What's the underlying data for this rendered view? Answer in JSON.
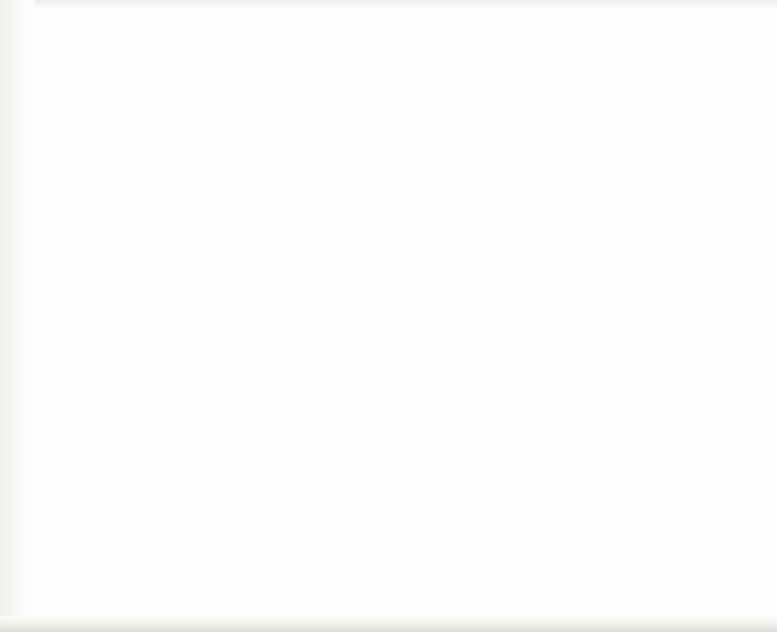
{
  "figure": {
    "copyright": "Copyright © 2018, Springer International Publishing AG, part of Springer Nature",
    "xlabel": "Effective Washcoat Depth (micron)"
  },
  "legend": {
    "position": "top-right",
    "entries": [
      {
        "label": "1 + 1D",
        "marker": "circle",
        "color": "#9c5334",
        "edge": "#5b3222"
      },
      {
        "label": "Asymptotic",
        "marker": "line",
        "color": "#6f6fc6"
      }
    ]
  },
  "colors": {
    "marker_fill": "#9c5334",
    "marker_edge": "#5b3222",
    "line": "#6f6fc6",
    "axis": "#3a3a3a",
    "grid": "#b9b9b9",
    "text": "#151515",
    "background": "#ffffff"
  },
  "chart_data": [
    {
      "type": "scatter",
      "panel": "top",
      "title": "",
      "xlabel": "Effective Washcoat Depth (micron)",
      "ylabel": "NH3 (ppm)",
      "xlim": [
        0,
        55
      ],
      "ylim": [
        20,
        412
      ],
      "xticks": [
        0,
        10,
        20,
        30,
        40,
        50,
        55
      ],
      "yticks": [
        100,
        200,
        300,
        400
      ],
      "grid": true,
      "legend": [
        "1 + 1D",
        "Asymptotic"
      ],
      "series": [
        {
          "name": "1 + 1D",
          "style": "markers",
          "x": [
            0,
            2,
            4,
            6,
            8,
            10,
            12,
            14,
            16,
            18,
            20,
            22,
            24,
            26,
            28,
            30,
            32,
            34,
            36,
            38,
            40,
            42,
            44,
            46,
            48,
            50,
            52
          ],
          "values": [
            349,
            333,
            320,
            305,
            292,
            278,
            265,
            252,
            240,
            228,
            216,
            205,
            194,
            184,
            174,
            164,
            155,
            147,
            139,
            131,
            124,
            117,
            111,
            105,
            100,
            95,
            91
          ]
        },
        {
          "name": "Asymptotic",
          "style": "line",
          "x": [
            0,
            2,
            4,
            6,
            8,
            10,
            12,
            14,
            16,
            18,
            20,
            22,
            24,
            26,
            28,
            30,
            32,
            34,
            36,
            38,
            40,
            42,
            44,
            46,
            48,
            50,
            52,
            53
          ],
          "values": [
            355,
            340,
            325,
            311,
            297,
            283,
            270,
            257,
            244,
            232,
            220,
            209,
            198,
            188,
            178,
            168,
            159,
            150,
            142,
            134,
            127,
            120,
            113,
            107,
            102,
            97,
            92,
            90
          ]
        }
      ]
    },
    {
      "type": "scatter",
      "panel": "bottom",
      "title": "",
      "xlabel": "Effective Washcoat Depth (micron)",
      "ylabel": "NO (ppm)",
      "xlim": [
        0,
        55
      ],
      "ylim": [
        200,
        400
      ],
      "xticks": [
        0,
        10,
        20,
        30,
        40,
        50,
        55
      ],
      "yticks": [
        200,
        250,
        300,
        350,
        400
      ],
      "grid": true,
      "legend": [
        "1 + 1D",
        "Asymptotic"
      ],
      "series": [
        {
          "name": "1 + 1D",
          "style": "markers",
          "x": [
            0,
            2,
            4,
            6,
            8,
            10,
            12,
            14,
            16,
            18,
            20,
            22,
            24,
            26,
            28,
            30,
            32,
            34,
            36,
            38,
            40,
            42,
            44,
            46,
            48,
            50,
            52
          ],
          "values": [
            400,
            389,
            373,
            360,
            348,
            338,
            324,
            314,
            305,
            297,
            288,
            282,
            275,
            269,
            263,
            257,
            252,
            248,
            244,
            240,
            237,
            233,
            230,
            228,
            225,
            223,
            221
          ]
        },
        {
          "name": "Asymptotic",
          "style": "line",
          "x": [
            0,
            2,
            4,
            6,
            8,
            10,
            12,
            14,
            16,
            18,
            20,
            22,
            24,
            26,
            28,
            30,
            32,
            34,
            36,
            38,
            40,
            42,
            44,
            46,
            48,
            50,
            52,
            53
          ],
          "values": [
            400,
            387,
            374,
            362,
            350,
            339,
            328,
            318,
            308,
            299,
            291,
            283,
            275,
            268,
            261,
            255,
            249,
            244,
            239,
            234,
            230,
            226,
            222,
            219,
            216,
            214,
            212,
            212
          ]
        }
      ]
    }
  ]
}
